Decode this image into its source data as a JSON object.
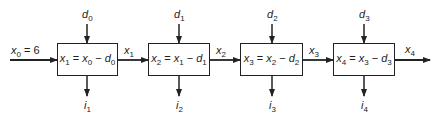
{
  "diagram": {
    "type": "serial multistage process",
    "initial_input": {
      "var": "x",
      "sub": "0",
      "value": "= 6"
    },
    "stages": [
      {
        "id": 1,
        "box": {
          "lhs_var": "x",
          "lhs_sub": "1",
          "a_var": "x",
          "a_sub": "0",
          "b_var": "d",
          "b_sub": "0"
        },
        "decision": {
          "var": "d",
          "sub": "0"
        },
        "return": {
          "var": "i",
          "sub": "1"
        },
        "output": {
          "var": "x",
          "sub": "1"
        }
      },
      {
        "id": 2,
        "box": {
          "lhs_var": "x",
          "lhs_sub": "2",
          "a_var": "x",
          "a_sub": "1",
          "b_var": "d",
          "b_sub": "1"
        },
        "decision": {
          "var": "d",
          "sub": "1"
        },
        "return": {
          "var": "i",
          "sub": "2"
        },
        "output": {
          "var": "x",
          "sub": "2"
        }
      },
      {
        "id": 3,
        "box": {
          "lhs_var": "x",
          "lhs_sub": "3",
          "a_var": "x",
          "a_sub": "2",
          "b_var": "d",
          "b_sub": "2"
        },
        "decision": {
          "var": "d",
          "sub": "2"
        },
        "return": {
          "var": "i",
          "sub": "3"
        },
        "output": {
          "var": "x",
          "sub": "3"
        }
      },
      {
        "id": 4,
        "box": {
          "lhs_var": "x",
          "lhs_sub": "4",
          "a_var": "x",
          "a_sub": "3",
          "b_var": "d",
          "b_sub": "3"
        },
        "decision": {
          "var": "d",
          "sub": "3"
        },
        "return": {
          "var": "i",
          "sub": "4"
        },
        "output": {
          "var": "x",
          "sub": "4"
        }
      }
    ],
    "operators": {
      "equals": "=",
      "minus": "−"
    },
    "colors": {
      "line": "#222222",
      "background": "#ffffff"
    }
  }
}
